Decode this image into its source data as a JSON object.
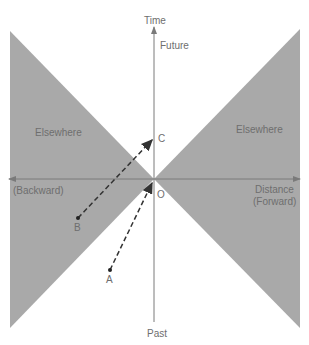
{
  "diagram": {
    "type": "spacetime-light-cone",
    "colors": {
      "elsewhere_fill": "#a9a9a9",
      "axis": "#7a7a7a",
      "arrow": "#333333",
      "text": "#6e6e6e"
    },
    "axes": {
      "time_label": "Time",
      "future_label": "Future",
      "past_label": "Past",
      "distance_label": "Distance",
      "forward_label": "(Forward)",
      "backward_label": "(Backward)"
    },
    "regions": [
      {
        "label": "Elsewhere",
        "side": "left"
      },
      {
        "label": "Elsewhere",
        "side": "right"
      }
    ],
    "origin_label": "O",
    "events": [
      {
        "label": "A",
        "role": "past event inside light cone"
      },
      {
        "label": "B",
        "role": "elsewhere event"
      },
      {
        "label": "C",
        "role": "future event on time axis"
      }
    ],
    "worldlines": [
      {
        "from": "A",
        "to": "O",
        "style": "dashed"
      },
      {
        "from": "B",
        "to": "C",
        "style": "dashed"
      }
    ]
  }
}
